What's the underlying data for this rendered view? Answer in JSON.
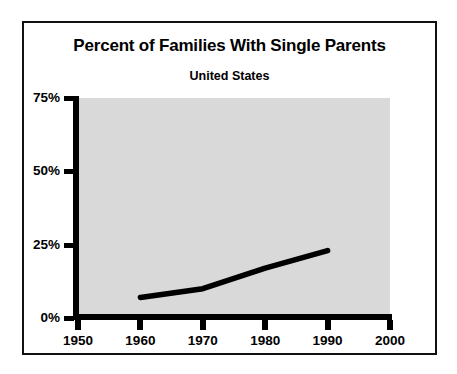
{
  "chart_data": {
    "type": "line",
    "title": "Percent of Families With Single Parents",
    "subtitle": "United States",
    "xlabel": "",
    "ylabel": "",
    "x": [
      1960,
      1970,
      1980,
      1990
    ],
    "values": [
      7,
      10,
      17,
      23
    ],
    "series": [
      {
        "name": "Percent of families with single parents",
        "x": [
          1960,
          1970,
          1980,
          1990
        ],
        "values": [
          7,
          10,
          17,
          23
        ]
      }
    ],
    "xlim": [
      1950,
      2000
    ],
    "ylim": [
      0,
      75
    ],
    "x_ticks": [
      1950,
      1960,
      1970,
      1980,
      1990,
      2000
    ],
    "x_tick_labels": [
      "1950",
      "1960",
      "1970",
      "1980",
      "1990",
      "2000"
    ],
    "y_ticks": [
      0,
      25,
      50,
      75
    ],
    "y_tick_labels": [
      "0%",
      "25%",
      "50%",
      "75%"
    ],
    "grid": false,
    "legend": false,
    "legend_position": "none",
    "annotations": [],
    "colors": {
      "plot_background": "#d9d9d9",
      "line": "#000000",
      "axis": "#000000",
      "text": "#000000",
      "frame": "#111111",
      "page_background": "#ffffff"
    }
  },
  "figure": {
    "title": "Percent of Families With Single Parents",
    "subtitle": "United States",
    "y_axis": {
      "ticks": [
        {
          "label": "75%",
          "value": 75
        },
        {
          "label": "50%",
          "value": 50
        },
        {
          "label": "25%",
          "value": 25
        },
        {
          "label": "0%",
          "value": 0
        }
      ]
    },
    "x_axis": {
      "ticks": [
        {
          "label": "1950",
          "value": 1950
        },
        {
          "label": "1960",
          "value": 1960
        },
        {
          "label": "1970",
          "value": 1970
        },
        {
          "label": "1980",
          "value": 1980
        },
        {
          "label": "1990",
          "value": 1990
        },
        {
          "label": "2000",
          "value": 2000
        }
      ]
    }
  }
}
